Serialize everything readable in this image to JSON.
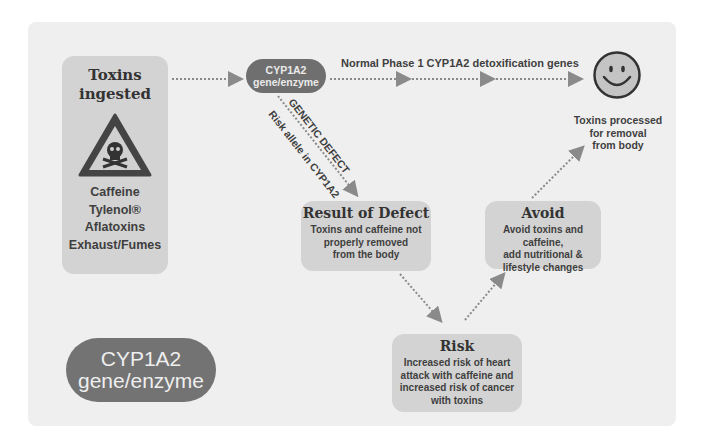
{
  "toxins_box": {
    "title_line1": "Toxins",
    "title_line2": "ingested",
    "icon": "warning-skull-triangle-icon",
    "items": [
      "Caffeine",
      "Tylenol®",
      "Aflatoxins",
      "Exhaust/Fumes"
    ]
  },
  "gene_node": {
    "line1": "CYP1A2",
    "line2": "gene/enzyme"
  },
  "normal_path": {
    "label": "Normal Phase 1 CYP1A2 detoxification genes"
  },
  "outcome": {
    "icon": "smiley-face-icon",
    "line1": "Toxins processed",
    "line2": "for removal",
    "line3": "from body"
  },
  "defect_path": {
    "label_upper": "GENETIC DEFECT",
    "label_lower": "Risk allele in CYP1A2"
  },
  "result_box": {
    "title": "Result of Defect",
    "line1": "Toxins and caffeine not",
    "line2": "properly removed",
    "line3": "from the body"
  },
  "avoid_box": {
    "title": "Avoid",
    "line1": "Avoid toxins and caffeine,",
    "line2": "add nutritional &",
    "line3": "lifestyle changes"
  },
  "risk_box": {
    "title": "Risk",
    "line1": "Increased risk of heart",
    "line2": "attack with caffeine and",
    "line3": "increased risk of cancer",
    "line4": "with toxins"
  },
  "legend_pill": {
    "line1": "CYP1A2",
    "line2": "gene/enzyme"
  },
  "colors": {
    "panel": "#efefef",
    "box": "#d3d3d3",
    "pill": "#6f6f6f",
    "arrow": "#8a8a8a",
    "text": "#3a3a3a"
  }
}
